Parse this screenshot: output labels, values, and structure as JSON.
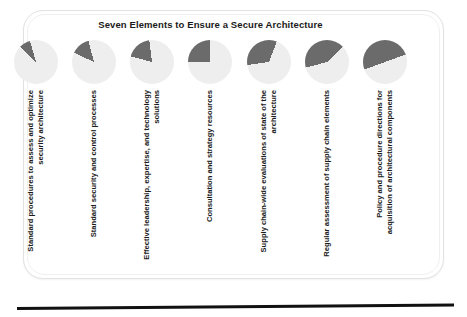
{
  "title": "Seven Elements to Ensure a Secure Architecture",
  "colors": {
    "slice": "#6b6b6b",
    "disc": "#eeeeee",
    "text": "#1a1a1a",
    "frame": "#e2e2e2",
    "rule": "#111111"
  },
  "chart_data": {
    "type": "pie",
    "title": "Seven Elements to Ensure a Secure Architecture",
    "xlabel": "",
    "ylabel": "",
    "legend": "none",
    "categories": [
      "Standard procedures to assess and optimize security architecture",
      "Standard security and control processes",
      "Effective leadership, expertise, and technology solutions",
      "Consultation and strategy resources",
      "Supply chain-wide evaluations of state of the architecture",
      "Regular assessment of supply chain elements",
      "Policy and procedure directions for acquisition of architectural components"
    ],
    "values": [
      8,
      14,
      19,
      25,
      33,
      42,
      50
    ],
    "units": "percent"
  },
  "elements": [
    {
      "index": 1,
      "label": "Standard procedures to assess and optimize security architecture",
      "value": 8,
      "start_deg": 315,
      "sweep_deg": 29
    },
    {
      "index": 2,
      "label": "Standard security and control processes",
      "value": 14,
      "start_deg": 295,
      "sweep_deg": 50
    },
    {
      "index": 3,
      "label": "Effective leadership, expertise, and technology solutions",
      "value": 19,
      "start_deg": 285,
      "sweep_deg": 68
    },
    {
      "index": 4,
      "label": "Consultation and strategy resources",
      "value": 25,
      "start_deg": 270,
      "sweep_deg": 90
    },
    {
      "index": 5,
      "label": "Supply chain-wide evaluations of state of the architecture",
      "value": 33,
      "start_deg": 262,
      "sweep_deg": 119
    },
    {
      "index": 6,
      "label": "Regular assessment of supply chain elements",
      "value": 42,
      "start_deg": 255,
      "sweep_deg": 151
    },
    {
      "index": 7,
      "label": "Policy and procedure directions for acquisition of architectural components",
      "value": 50,
      "start_deg": 250,
      "sweep_deg": 180
    }
  ]
}
